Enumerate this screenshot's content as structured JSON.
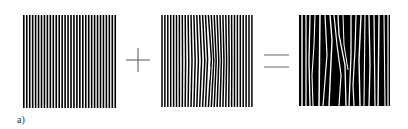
{
  "figure": {
    "label": "a)",
    "panels": [
      {
        "name": "reference-grating",
        "description": "uniform vertical line grating",
        "stripe_count": 32
      },
      {
        "name": "deformed-grating",
        "description": "vertical line grating with local distortion near center",
        "stripe_count": 32
      },
      {
        "name": "moire-pattern",
        "description": "superposition producing moiré fringes"
      }
    ],
    "operators": [
      "+",
      "="
    ],
    "colors": {
      "ink": "#000000",
      "background": "#ffffff",
      "operator": "#666666"
    }
  }
}
